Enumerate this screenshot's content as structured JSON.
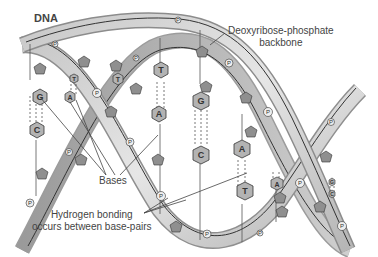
{
  "title": "DNA",
  "labels": {
    "backbone_line1": "Deoxyribose-phosphate",
    "backbone_line2": "backbone",
    "bases": "Bases",
    "hbond_line1": "Hydrogen bonding",
    "hbond_line2": "occurs between base-pairs"
  },
  "phosphate_symbol": "P",
  "base_pairs": [
    {
      "top": "G",
      "bottom": "C",
      "x": 36
    },
    {
      "top": "T",
      "bottom": "A",
      "x": 73
    },
    {
      "top": "T",
      "bottom": "",
      "x": 118
    },
    {
      "top": "T",
      "bottom": "A",
      "x": 161
    },
    {
      "top": "G",
      "bottom": "C",
      "x": 201
    },
    {
      "top": "A",
      "bottom": "T",
      "x": 242
    },
    {
      "top": "A",
      "bottom": "",
      "x": 276
    },
    {
      "top": "G",
      "bottom": "C",
      "x": 332
    }
  ],
  "colors": {
    "ribbon_light": "#d9d9d9",
    "ribbon_dark": "#a8a8a8",
    "base_fill": "#b3b3b3",
    "sugar_fill": "#8f8f8f",
    "line": "#333333"
  }
}
